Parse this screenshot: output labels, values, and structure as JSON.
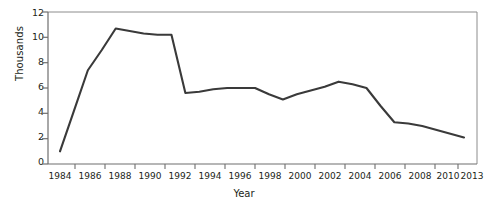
{
  "chart_data": {
    "type": "line",
    "title": "",
    "xlabel": "Year",
    "ylabel": "Thousands",
    "x": [
      1984,
      1985,
      1986,
      1987,
      1988,
      1989,
      1990,
      1991,
      1992,
      1993,
      1994,
      1995,
      1996,
      1997,
      1998,
      1999,
      2000,
      2001,
      2002,
      2003,
      2004,
      2005,
      2006,
      2007,
      2008,
      2009,
      2010,
      2013
    ],
    "values": [
      1.0,
      4.2,
      7.4,
      9.0,
      10.7,
      10.5,
      10.3,
      10.2,
      10.2,
      5.6,
      5.7,
      5.9,
      6.0,
      6.0,
      6.0,
      5.5,
      5.1,
      5.5,
      5.8,
      6.1,
      6.5,
      6.3,
      6.0,
      4.6,
      3.3,
      3.2,
      3.0,
      2.1
    ],
    "xtick_labels": [
      "1984",
      "1986",
      "1988",
      "1990",
      "1992",
      "1994",
      "1996",
      "1998",
      "2000",
      "2002",
      "2004",
      "2006",
      "2008",
      "2010",
      "2013"
    ],
    "ytick_labels": [
      "0",
      "2",
      "4",
      "6",
      "8",
      "10",
      "12"
    ],
    "ylim": [
      0,
      12
    ],
    "xlim": [
      1984,
      2013
    ],
    "grid": false,
    "legend": "none",
    "line_color": "#3a3a3a",
    "axis_color": "#808080"
  }
}
